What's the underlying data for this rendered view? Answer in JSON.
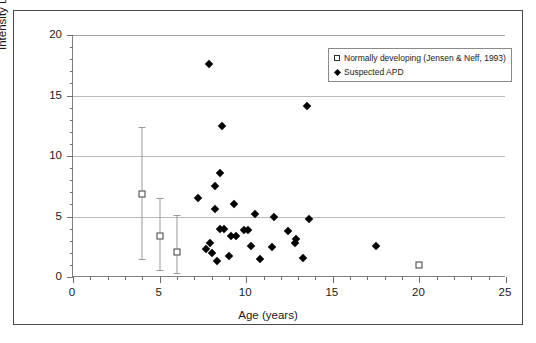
{
  "chart_data": {
    "type": "scatter",
    "title": "",
    "xlabel": "Age (years)",
    "ylabel": "Intensity Discrimination Threshold (dB)",
    "xlim": [
      0,
      25
    ],
    "ylim": [
      0,
      20
    ],
    "xticks": [
      0,
      5,
      10,
      15,
      20,
      25
    ],
    "yticks": [
      0,
      5,
      10,
      15,
      20
    ],
    "xtick_labels": [
      "0",
      "5",
      "10",
      "15",
      "20",
      "25"
    ],
    "ytick_labels": [
      "0",
      "5",
      "10",
      "15",
      "20"
    ],
    "x_minor_tick_step": 1,
    "y_minor_tick_step": 1,
    "grid": "horizontal-major",
    "legend_position": "top-right-inside",
    "series": [
      {
        "name": "Normally developing (Jensen & Neff, 1993)",
        "marker": "open-square",
        "has_error_bars": true,
        "points": [
          {
            "x": 4,
            "y": 6.9,
            "y_low": 1.5,
            "y_high": 12.4
          },
          {
            "x": 5,
            "y": 3.4,
            "y_low": 0.6,
            "y_high": 6.5
          },
          {
            "x": 6,
            "y": 2.1,
            "y_low": 0.3,
            "y_high": 5.1
          },
          {
            "x": 20,
            "y": 1.0,
            "y_low": 1.0,
            "y_high": 1.0
          }
        ]
      },
      {
        "name": "Suspected APD",
        "marker": "filled-diamond",
        "has_error_bars": false,
        "points": [
          {
            "x": 7.85,
            "y": 17.6
          },
          {
            "x": 8.6,
            "y": 12.5
          },
          {
            "x": 13.5,
            "y": 14.1
          },
          {
            "x": 8.5,
            "y": 8.6
          },
          {
            "x": 8.2,
            "y": 7.5
          },
          {
            "x": 7.2,
            "y": 6.5
          },
          {
            "x": 9.3,
            "y": 6.0
          },
          {
            "x": 8.2,
            "y": 5.6
          },
          {
            "x": 10.5,
            "y": 5.2
          },
          {
            "x": 11.6,
            "y": 5.0
          },
          {
            "x": 13.6,
            "y": 4.8
          },
          {
            "x": 8.5,
            "y": 4.0
          },
          {
            "x": 8.7,
            "y": 4.0
          },
          {
            "x": 9.9,
            "y": 3.9
          },
          {
            "x": 10.1,
            "y": 3.9
          },
          {
            "x": 12.4,
            "y": 3.8
          },
          {
            "x": 9.1,
            "y": 3.4
          },
          {
            "x": 9.4,
            "y": 3.4
          },
          {
            "x": 12.9,
            "y": 3.1
          },
          {
            "x": 12.8,
            "y": 2.8
          },
          {
            "x": 7.9,
            "y": 2.8
          },
          {
            "x": 10.3,
            "y": 2.6
          },
          {
            "x": 11.5,
            "y": 2.5
          },
          {
            "x": 17.5,
            "y": 2.6
          },
          {
            "x": 7.7,
            "y": 2.3
          },
          {
            "x": 8.0,
            "y": 2.0
          },
          {
            "x": 9.0,
            "y": 1.7
          },
          {
            "x": 13.3,
            "y": 1.6
          },
          {
            "x": 10.8,
            "y": 1.5
          },
          {
            "x": 8.3,
            "y": 1.3
          }
        ]
      }
    ]
  },
  "legend": {
    "entries": [
      {
        "label": "Normally developing (Jensen & Neff, 1993)",
        "marker": "open-square"
      },
      {
        "label": "Suspected APD",
        "marker": "filled-diamond"
      }
    ]
  },
  "colors": {
    "marker_fill": "#000000",
    "marker_outline": "#3d3d3d",
    "gridline": "#b9b9b9",
    "axis": "#808080",
    "frame": "#4a4a4a",
    "text": "#1a1a1a",
    "errorbar": "#9a9a9a"
  }
}
